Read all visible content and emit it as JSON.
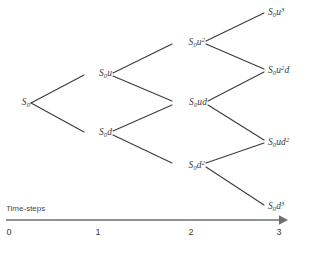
{
  "figure": {
    "background_color": "#ffffff",
    "edge_color": "#3a3a3a",
    "text_color": "#3b3b3b",
    "axis_color": "#6e6e6e"
  },
  "axis": {
    "caption": "Time-steps",
    "ticks": [
      "0",
      "1",
      "2",
      "3"
    ],
    "arrow": "right-arrow-icon"
  },
  "nodes": [
    {
      "id": "s0",
      "step": 0,
      "label_html": "S<sub>0</sub>",
      "label_text": "S0"
    },
    {
      "id": "s0u",
      "step": 1,
      "label_html": "S<sub>0</sub>u",
      "label_text": "S0u"
    },
    {
      "id": "s0d",
      "step": 1,
      "label_html": "S<sub>0</sub>d",
      "label_text": "S0d"
    },
    {
      "id": "s0u2",
      "step": 2,
      "label_html": "S<sub>0</sub>u<sup>2</sup>",
      "label_text": "S0u2"
    },
    {
      "id": "s0ud",
      "step": 2,
      "label_html": "S<sub>0</sub>ud",
      "label_text": "S0ud"
    },
    {
      "id": "s0d2",
      "step": 2,
      "label_html": "S<sub>0</sub>d<sup>2</sup>",
      "label_text": "S0d2"
    },
    {
      "id": "s0u3",
      "step": 3,
      "label_html": "S<sub>0</sub>u<sup>3</sup>",
      "label_text": "S0u3"
    },
    {
      "id": "s0u2d",
      "step": 3,
      "label_html": "S<sub>0</sub>u<sup>2</sup>d",
      "label_text": "S0u2d"
    },
    {
      "id": "s0ud2",
      "step": 3,
      "label_html": "S<sub>0</sub>ud<sup>2</sup>",
      "label_text": "S0ud2"
    },
    {
      "id": "s0d3",
      "step": 3,
      "label_html": "S<sub>0</sub>d<sup>3</sup>",
      "label_text": "S0d3"
    }
  ],
  "chart_data": {
    "type": "diagram",
    "subtype": "binomial-tree",
    "xlabel": "Time-steps",
    "x_ticks": [
      0,
      1,
      2,
      3
    ],
    "nodes": [
      {
        "id": "s0",
        "step": 0,
        "level": 0,
        "label": "S0",
        "x": 18,
        "y": 103
      },
      {
        "id": "s0u",
        "step": 1,
        "level": 1,
        "label": "S0u",
        "x": 110,
        "y": 74
      },
      {
        "id": "s0d",
        "step": 1,
        "level": -1,
        "label": "S0d",
        "x": 110,
        "y": 133
      },
      {
        "id": "s0u2",
        "step": 2,
        "level": 2,
        "label": "S0u2",
        "x": 180,
        "y": 42
      },
      {
        "id": "s0ud",
        "step": 2,
        "level": 0,
        "label": "S0ud",
        "x": 180,
        "y": 103
      },
      {
        "id": "s0d2",
        "step": 2,
        "level": -2,
        "label": "S0d2",
        "x": 180,
        "y": 165
      },
      {
        "id": "s0u3",
        "step": 3,
        "level": 3,
        "label": "S0u3",
        "x": 273,
        "y": 12
      },
      {
        "id": "s0u2d",
        "step": 3,
        "level": 1,
        "label": "S0u2d",
        "x": 273,
        "y": 70
      },
      {
        "id": "s0ud2",
        "step": 3,
        "level": -1,
        "label": "S0ud2",
        "x": 273,
        "y": 142
      },
      {
        "id": "s0d3",
        "step": 3,
        "level": -3,
        "label": "S0d3",
        "x": 273,
        "y": 206
      }
    ],
    "edges": [
      {
        "from": "s0",
        "to": "s0u",
        "move": "up"
      },
      {
        "from": "s0",
        "to": "s0d",
        "move": "down"
      },
      {
        "from": "s0u",
        "to": "s0u2",
        "move": "up"
      },
      {
        "from": "s0u",
        "to": "s0ud",
        "move": "down"
      },
      {
        "from": "s0d",
        "to": "s0ud",
        "move": "up"
      },
      {
        "from": "s0d",
        "to": "s0d2",
        "move": "down"
      },
      {
        "from": "s0u2",
        "to": "s0u3",
        "move": "up"
      },
      {
        "from": "s0u2",
        "to": "s0u2d",
        "move": "down"
      },
      {
        "from": "s0ud",
        "to": "s0u2d",
        "move": "up"
      },
      {
        "from": "s0ud",
        "to": "s0ud2",
        "move": "down"
      },
      {
        "from": "s0d2",
        "to": "s0ud2",
        "move": "up"
      },
      {
        "from": "s0d2",
        "to": "s0d3",
        "move": "down"
      }
    ],
    "grid": false,
    "legend": null
  }
}
